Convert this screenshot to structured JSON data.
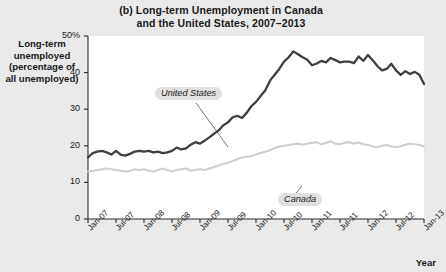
{
  "figure": {
    "panel_letter": "(b)",
    "title_line1": "(b) Long-term Unemployment in Canada",
    "title_line2": "and the United States, 2007–2013",
    "ylabel_line1": "Long-term",
    "ylabel_line2": "unemployed",
    "ylabel_line3": "(percentage of",
    "ylabel_line4": "all unemployed)",
    "xlabel": "Year",
    "background_color": "#e9e9e9",
    "plot_background_color": "#ffffff",
    "us_color": "#3f3f3f",
    "canada_color": "#cfcfcf"
  },
  "ytick_labels": [
    "50%",
    "40",
    "30",
    "20",
    "10",
    "0"
  ],
  "series_tags": {
    "united_states": "United States",
    "canada": "Canada"
  },
  "chart_data": {
    "type": "line",
    "title": "(b) Long-term Unemployment in Canada and the United States, 2007–2013",
    "xlabel": "Year",
    "ylabel": "Long-term unemployed (percentage of all unemployed)",
    "ylim": [
      0,
      50
    ],
    "yticks": [
      0,
      10,
      20,
      30,
      40,
      50
    ],
    "ytick_labels": [
      "0",
      "10",
      "20",
      "30",
      "40",
      "50%"
    ],
    "grid": false,
    "legend_position": "inline-labels",
    "x_tick_labels": [
      "Jan-07",
      "Jul-07",
      "Jan-08",
      "Jul-08",
      "Jan-09",
      "Jul-09",
      "Jan-10",
      "Jul-10",
      "Jan-11",
      "Jul-11",
      "Jan-12",
      "Jul-12",
      "Jan-13"
    ],
    "x_tick_values": [
      0,
      6,
      12,
      18,
      24,
      30,
      36,
      42,
      48,
      54,
      60,
      66,
      72
    ],
    "x_months": [
      0,
      1,
      2,
      3,
      4,
      5,
      6,
      7,
      8,
      9,
      10,
      11,
      12,
      13,
      14,
      15,
      16,
      17,
      18,
      19,
      20,
      21,
      22,
      23,
      24,
      25,
      26,
      27,
      28,
      29,
      30,
      31,
      32,
      33,
      34,
      35,
      36,
      37,
      38,
      39,
      40,
      41,
      42,
      43,
      44,
      45,
      46,
      47,
      48,
      49,
      50,
      51,
      52,
      53,
      54,
      55,
      56,
      57,
      58,
      59,
      60,
      61,
      62,
      63,
      64,
      65,
      66,
      67,
      68,
      69,
      70,
      71,
      72
    ],
    "series": [
      {
        "name": "United States",
        "color": "#3f3f3f",
        "values": [
          16.8,
          18.0,
          18.4,
          18.6,
          18.2,
          17.6,
          18.6,
          17.6,
          17.3,
          17.8,
          18.4,
          18.6,
          18.4,
          18.6,
          18.2,
          18.4,
          18.0,
          18.2,
          18.6,
          19.5,
          19.0,
          19.3,
          20.3,
          21.0,
          20.6,
          21.4,
          22.3,
          23.3,
          24.2,
          25.6,
          26.4,
          27.8,
          28.2,
          27.6,
          29.0,
          30.8,
          32.0,
          33.6,
          35.2,
          37.8,
          39.4,
          41.0,
          43.0,
          44.2,
          45.8,
          45.0,
          44.2,
          43.5,
          42.0,
          42.5,
          43.2,
          42.8,
          44.0,
          43.4,
          42.8,
          43.0,
          43.0,
          42.6,
          44.4,
          43.2,
          44.8,
          43.4,
          41.8,
          40.6,
          41.0,
          42.4,
          40.6,
          39.4,
          40.4,
          39.6,
          40.2,
          39.4,
          36.9
        ]
      },
      {
        "name": "Canada",
        "color": "#cfcfcf",
        "values": [
          13.0,
          13.2,
          13.4,
          13.6,
          13.8,
          13.6,
          13.4,
          13.2,
          13.0,
          13.2,
          13.6,
          13.4,
          13.6,
          13.2,
          13.0,
          13.4,
          13.8,
          13.4,
          13.0,
          13.4,
          13.6,
          13.8,
          13.2,
          13.4,
          13.6,
          13.4,
          13.8,
          14.2,
          14.6,
          15.0,
          15.4,
          15.8,
          16.4,
          16.8,
          17.0,
          17.2,
          17.6,
          18.0,
          18.4,
          18.8,
          19.4,
          19.8,
          20.0,
          20.2,
          20.4,
          20.6,
          20.3,
          20.6,
          20.8,
          21.0,
          20.4,
          20.8,
          21.2,
          20.6,
          20.4,
          20.8,
          21.0,
          20.6,
          20.9,
          20.4,
          20.2,
          19.8,
          19.6,
          20.0,
          20.2,
          19.8,
          19.6,
          19.9,
          20.3,
          20.6,
          20.4,
          20.2,
          19.9
        ]
      }
    ],
    "annotations": [
      {
        "text": "United States",
        "series": "United States",
        "x_month": 27
      },
      {
        "text": "Canada",
        "series": "Canada",
        "x_month": 50
      }
    ]
  }
}
